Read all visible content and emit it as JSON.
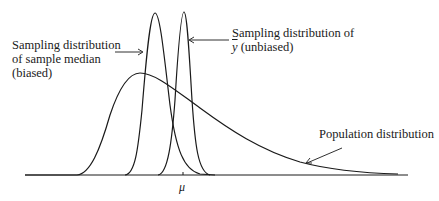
{
  "diagram": {
    "labels": {
      "median_line1": "Sampling distribution",
      "median_line2": "of sample median",
      "median_line3": "(biased)",
      "ybar_line1": "Sampling distribution of",
      "ybar_symbol": "y",
      "ybar_rest": " (unbiased)",
      "population": "Population distribution",
      "mu": "μ"
    },
    "curves": [
      {
        "name": "population distribution",
        "shape": "right-skewed",
        "peak_x": 140
      },
      {
        "name": "sampling distribution of sample median",
        "shape": "narrow, biased left of mu",
        "peak_x": 155
      },
      {
        "name": "sampling distribution of y-bar",
        "shape": "narrow, centered at mu",
        "peak_x": 183
      }
    ],
    "line_color": "#1a1a1a"
  }
}
